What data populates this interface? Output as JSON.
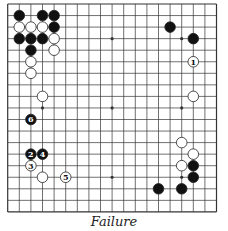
{
  "diagram": {
    "type": "go-board",
    "size": 19,
    "caption": "Failure",
    "colors": {
      "line": "#333333",
      "black": "#111111",
      "white": "#ffffff",
      "stone_outline": "#222222"
    },
    "star_points": [
      [
        3,
        3
      ],
      [
        3,
        9
      ],
      [
        3,
        15
      ],
      [
        9,
        3
      ],
      [
        9,
        9
      ],
      [
        9,
        15
      ],
      [
        15,
        3
      ],
      [
        15,
        9
      ],
      [
        15,
        15
      ]
    ],
    "stones": [
      {
        "col": 1,
        "row": 1,
        "color": "black"
      },
      {
        "col": 3,
        "row": 1,
        "color": "black"
      },
      {
        "col": 4,
        "row": 1,
        "color": "black"
      },
      {
        "col": 1,
        "row": 2,
        "color": "white"
      },
      {
        "col": 2,
        "row": 2,
        "color": "white"
      },
      {
        "col": 3,
        "row": 2,
        "color": "white"
      },
      {
        "col": 4,
        "row": 2,
        "color": "black"
      },
      {
        "col": 1,
        "row": 3,
        "color": "black"
      },
      {
        "col": 2,
        "row": 3,
        "color": "black"
      },
      {
        "col": 3,
        "row": 3,
        "color": "black"
      },
      {
        "col": 4,
        "row": 3,
        "color": "white"
      },
      {
        "col": 2,
        "row": 4,
        "color": "black"
      },
      {
        "col": 4,
        "row": 4,
        "color": "white"
      },
      {
        "col": 2,
        "row": 5,
        "color": "white"
      },
      {
        "col": 2,
        "row": 6,
        "color": "white"
      },
      {
        "col": 3,
        "row": 8,
        "color": "white"
      },
      {
        "col": 14,
        "row": 2,
        "color": "black"
      },
      {
        "col": 16,
        "row": 3,
        "color": "black"
      },
      {
        "col": 16,
        "row": 5,
        "color": "white",
        "label": "1"
      },
      {
        "col": 16,
        "row": 8,
        "color": "white"
      },
      {
        "col": 2,
        "row": 10,
        "color": "black",
        "label": "6"
      },
      {
        "col": 2,
        "row": 13,
        "color": "black",
        "label": "2"
      },
      {
        "col": 3,
        "row": 13,
        "color": "black",
        "label": "4"
      },
      {
        "col": 2,
        "row": 14,
        "color": "white",
        "label": "3"
      },
      {
        "col": 3,
        "row": 15,
        "color": "white"
      },
      {
        "col": 5,
        "row": 15,
        "color": "white",
        "label": "5"
      },
      {
        "col": 15,
        "row": 12,
        "color": "white"
      },
      {
        "col": 16,
        "row": 13,
        "color": "white"
      },
      {
        "col": 15,
        "row": 14,
        "color": "white"
      },
      {
        "col": 16,
        "row": 14,
        "color": "black"
      },
      {
        "col": 16,
        "row": 15,
        "color": "black"
      },
      {
        "col": 13,
        "row": 16,
        "color": "black"
      },
      {
        "col": 15,
        "row": 16,
        "color": "black"
      }
    ]
  }
}
